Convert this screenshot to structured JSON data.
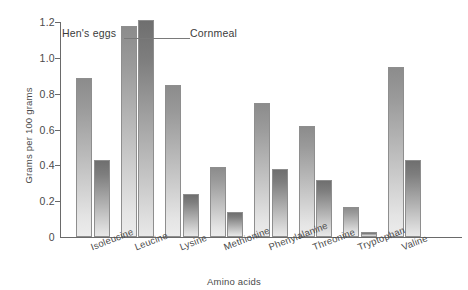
{
  "chart_data": {
    "type": "bar",
    "title": "",
    "xlabel": "Amino acids",
    "ylabel": "Grams per 100 grams",
    "categories": [
      "Isoleucine",
      "Leucine",
      "Lysine",
      "Methionine",
      "Phenylalanine",
      "Threonine",
      "Tryptophan",
      "Valine"
    ],
    "series": [
      {
        "name": "Hen's eggs",
        "values": [
          0.89,
          1.18,
          0.85,
          0.39,
          0.75,
          0.62,
          0.17,
          0.95
        ]
      },
      {
        "name": "Cornmeal",
        "values": [
          0.43,
          1.21,
          0.24,
          0.14,
          0.38,
          0.32,
          0.03,
          0.43
        ]
      }
    ],
    "ylim": [
      0,
      1.2
    ],
    "ytick_labels": [
      "0",
      "0.2",
      "0.4",
      "0.6",
      "0.8",
      "1.0",
      "1.2"
    ],
    "ytick_values": [
      0,
      0.2,
      0.4,
      0.6,
      0.8,
      1.0,
      1.2
    ],
    "grid": false,
    "legend_position": "inline-annotations",
    "annotations": [
      {
        "text": "Hen's eggs",
        "points_to": "Leucine / Hen's eggs bar"
      },
      {
        "text": "Cornmeal",
        "points_to": "Leucine / Cornmeal bar"
      }
    ]
  }
}
